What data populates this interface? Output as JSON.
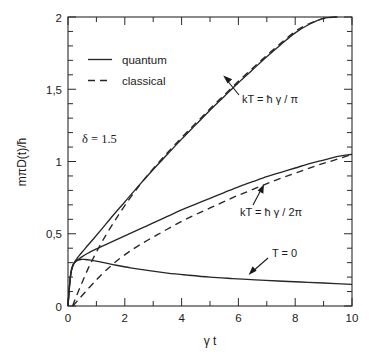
{
  "chart_data": {
    "type": "line",
    "title": "",
    "xlabel": "γ t",
    "ylabel": "mπD(t)/ħ",
    "xlim": [
      0,
      10
    ],
    "ylim": [
      0,
      2
    ],
    "grid": false,
    "legend_position": "upper-left-inside",
    "xticks": [
      0,
      2,
      4,
      6,
      8,
      10
    ],
    "xtick_labels": [
      "0",
      "2",
      "4",
      "6",
      "8",
      "10"
    ],
    "xminor_ticks": [
      1,
      3,
      5,
      7,
      9
    ],
    "yticks": [
      0,
      0.5,
      1,
      1.5,
      2
    ],
    "ytick_labels": [
      "0",
      "0,5",
      "1",
      "1,5",
      "2"
    ],
    "yminor_step": 0.1,
    "legend": [
      {
        "label": "quantum",
        "style": "solid"
      },
      {
        "label": "classical",
        "style": "dashed"
      }
    ],
    "annotations": [
      {
        "text": "δ = 1.5",
        "x": 1.45,
        "y": 1.37,
        "kind": "parameter"
      },
      {
        "text": "kT = ħ γ / π",
        "x": 6.25,
        "y": 1.47,
        "kind": "curve-label",
        "arrow_to_x": 5.55,
        "arrow_to_y": 1.66
      },
      {
        "text": "kT = ħ  γ / 2π",
        "x": 6.05,
        "y": 0.63,
        "kind": "curve-label",
        "arrow_to_x": 6.45,
        "arrow_to_y": 0.88
      },
      {
        "text": "T = 0",
        "x": 7.05,
        "y": 0.31,
        "kind": "curve-label",
        "arrow_to_x": 6.05,
        "arrow_to_y": 0.185
      }
    ],
    "series": [
      {
        "name": "kT = hbar*gamma/pi, quantum",
        "style": "solid",
        "x": [
          0.0,
          0.05,
          0.1,
          0.15,
          0.2,
          0.3,
          0.4,
          0.55,
          0.7,
          0.9,
          1.2,
          1.6,
          2.0,
          2.5,
          3.0,
          3.5,
          4.0,
          4.5,
          5.0,
          5.5,
          6.0,
          6.5,
          7.0,
          7.5,
          8.0,
          8.5,
          9.0,
          9.45
        ],
        "y": [
          0.0,
          0.14,
          0.23,
          0.27,
          0.295,
          0.325,
          0.35,
          0.385,
          0.42,
          0.465,
          0.535,
          0.63,
          0.72,
          0.835,
          0.945,
          1.05,
          1.155,
          1.255,
          1.355,
          1.45,
          1.545,
          1.635,
          1.725,
          1.81,
          1.89,
          1.95,
          1.99,
          2.0
        ]
      },
      {
        "name": "kT = hbar*gamma/pi, classical",
        "style": "dashed",
        "x": [
          0.16,
          0.3,
          0.5,
          0.7,
          0.9,
          1.2,
          1.6,
          2.0,
          2.5,
          3.0,
          3.5,
          4.0,
          4.5,
          5.0,
          5.5,
          6.0,
          6.5,
          7.0,
          7.5,
          8.0,
          8.5,
          9.0,
          9.5
        ],
        "y": [
          0.0,
          0.07,
          0.165,
          0.255,
          0.335,
          0.445,
          0.575,
          0.695,
          0.83,
          0.95,
          1.06,
          1.165,
          1.265,
          1.365,
          1.46,
          1.555,
          1.645,
          1.735,
          1.82,
          1.9,
          1.955,
          1.99,
          2.0
        ]
      },
      {
        "name": "kT = hbar*gamma/2pi, quantum",
        "style": "solid",
        "x": [
          0.0,
          0.05,
          0.1,
          0.15,
          0.2,
          0.3,
          0.45,
          0.7,
          1.0,
          1.5,
          2.0,
          2.5,
          3.0,
          3.5,
          4.0,
          4.5,
          5.0,
          5.5,
          6.0,
          6.5,
          7.0,
          7.5,
          8.0,
          8.5,
          9.0,
          9.5,
          10.0
        ],
        "y": [
          0.0,
          0.13,
          0.22,
          0.265,
          0.29,
          0.315,
          0.335,
          0.365,
          0.395,
          0.44,
          0.485,
          0.53,
          0.575,
          0.62,
          0.665,
          0.705,
          0.745,
          0.785,
          0.825,
          0.86,
          0.895,
          0.925,
          0.955,
          0.985,
          1.01,
          1.035,
          1.05
        ]
      },
      {
        "name": "kT = hbar*gamma/2pi, classical",
        "style": "dashed",
        "x": [
          0.17,
          0.35,
          0.6,
          0.9,
          1.3,
          1.8,
          2.3,
          2.8,
          3.3,
          3.8,
          4.3,
          4.8,
          5.3,
          5.8,
          6.3,
          6.8,
          7.3,
          7.8,
          8.3,
          8.8,
          9.3,
          10.0
        ],
        "y": [
          0.0,
          0.04,
          0.095,
          0.16,
          0.24,
          0.325,
          0.395,
          0.455,
          0.51,
          0.565,
          0.615,
          0.66,
          0.705,
          0.75,
          0.79,
          0.83,
          0.87,
          0.905,
          0.94,
          0.975,
          1.005,
          1.05
        ]
      },
      {
        "name": "T = 0, quantum",
        "style": "solid",
        "x": [
          0.0,
          0.05,
          0.1,
          0.15,
          0.2,
          0.3,
          0.45,
          0.6,
          0.8,
          1.0,
          1.3,
          1.7,
          2.2,
          2.8,
          3.5,
          4.2,
          5.0,
          5.8,
          6.6,
          7.4,
          8.2,
          9.0,
          10.0
        ],
        "y": [
          0.0,
          0.13,
          0.225,
          0.27,
          0.292,
          0.312,
          0.322,
          0.322,
          0.317,
          0.31,
          0.298,
          0.282,
          0.264,
          0.246,
          0.228,
          0.214,
          0.2,
          0.19,
          0.181,
          0.173,
          0.166,
          0.159,
          0.15
        ]
      }
    ]
  },
  "axes": {
    "x_title": "γ t",
    "y_title": "mπD(t)/ħ"
  },
  "legend": {
    "quantum_label": "quantum",
    "classical_label": "classical"
  },
  "labels": {
    "delta": "δ = 1.5",
    "kt_pi": "kT = ħ γ / π",
    "kt_2pi": "kT = ħ  γ / 2π",
    "t_zero": "T = 0"
  },
  "xtick_0": "0",
  "xtick_2": "2",
  "xtick_4": "4",
  "xtick_6": "6",
  "xtick_8": "8",
  "xtick_10": "10",
  "ytick_0": "0",
  "ytick_05": "0,5",
  "ytick_1": "1",
  "ytick_15": "1,5",
  "ytick_2": "2"
}
